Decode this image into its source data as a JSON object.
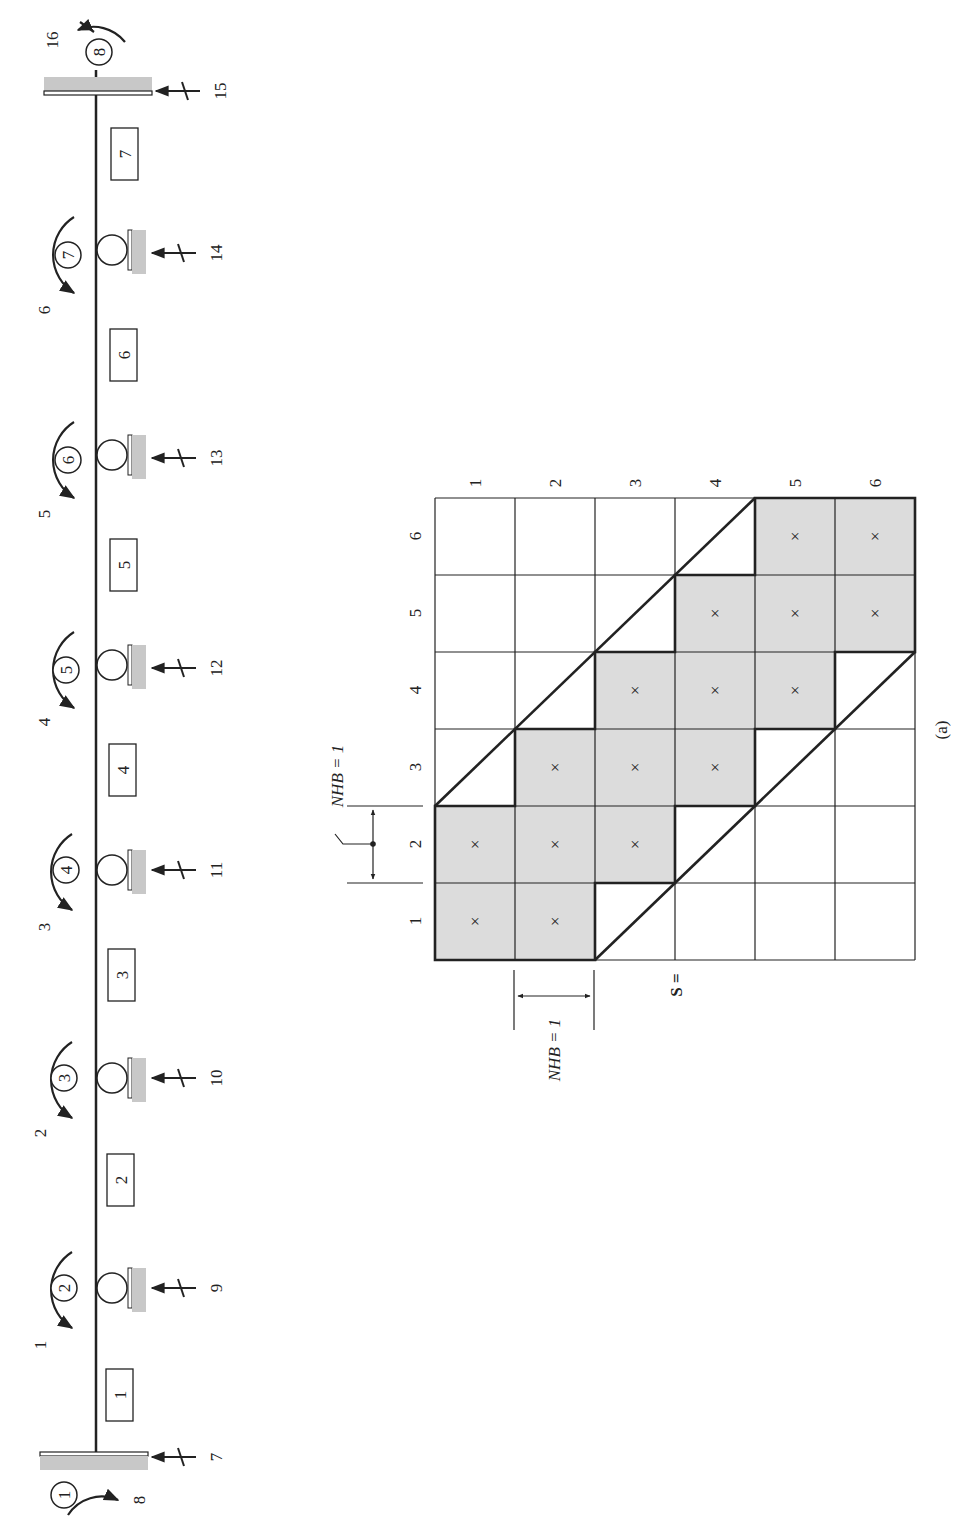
{
  "figure": {
    "caption": "(a)",
    "rotation_deg": -90
  },
  "beam": {
    "joints": [
      {
        "id": "1",
        "label": "1",
        "type": "fixed",
        "y": 1460,
        "rotation_dof": "8",
        "vertical_dof": "7"
      },
      {
        "id": "2",
        "label": "2",
        "type": "roller",
        "y": 1288,
        "rotation_dof": "1",
        "vertical_dof": "9"
      },
      {
        "id": "3",
        "label": "3",
        "type": "roller",
        "y": 1078,
        "rotation_dof": "2",
        "vertical_dof": "10"
      },
      {
        "id": "4",
        "label": "4",
        "type": "roller",
        "y": 870,
        "rotation_dof": "3",
        "vertical_dof": "11"
      },
      {
        "id": "5",
        "label": "5",
        "type": "roller",
        "y": 665,
        "rotation_dof": "4",
        "vertical_dof": "12"
      },
      {
        "id": "6",
        "label": "6",
        "type": "roller",
        "y": 455,
        "rotation_dof": "5",
        "vertical_dof": "13"
      },
      {
        "id": "7",
        "label": "7",
        "type": "roller",
        "y": 250,
        "rotation_dof": "6",
        "vertical_dof": "14"
      },
      {
        "id": "8",
        "label": "8",
        "type": "fixed",
        "y": 55,
        "rotation_dof": "16",
        "vertical_dof": "15"
      }
    ],
    "members": [
      {
        "label": "1",
        "y": 1395
      },
      {
        "label": "2",
        "y": 1180
      },
      {
        "label": "3",
        "y": 975
      },
      {
        "label": "4",
        "y": 770
      },
      {
        "label": "5",
        "y": 565
      },
      {
        "label": "6",
        "y": 355
      },
      {
        "label": "7",
        "y": 155
      }
    ]
  },
  "matrix": {
    "name": "S =",
    "size": 6,
    "row_labels": [
      "1",
      "2",
      "3",
      "4",
      "5",
      "6"
    ],
    "col_labels": [
      "1",
      "2",
      "3",
      "4",
      "5",
      "6"
    ],
    "nonzero_marker": "×",
    "nonzero_entries": [
      [
        1,
        1
      ],
      [
        1,
        2
      ],
      [
        2,
        1
      ],
      [
        2,
        2
      ],
      [
        2,
        3
      ],
      [
        3,
        2
      ],
      [
        3,
        3
      ],
      [
        3,
        4
      ],
      [
        4,
        3
      ],
      [
        4,
        4
      ],
      [
        4,
        5
      ],
      [
        5,
        4
      ],
      [
        5,
        5
      ],
      [
        5,
        6
      ],
      [
        6,
        5
      ],
      [
        6,
        6
      ]
    ],
    "half_bandwidth_label_top": "NHB = 1",
    "half_bandwidth_label_left": "NHB = 1"
  }
}
